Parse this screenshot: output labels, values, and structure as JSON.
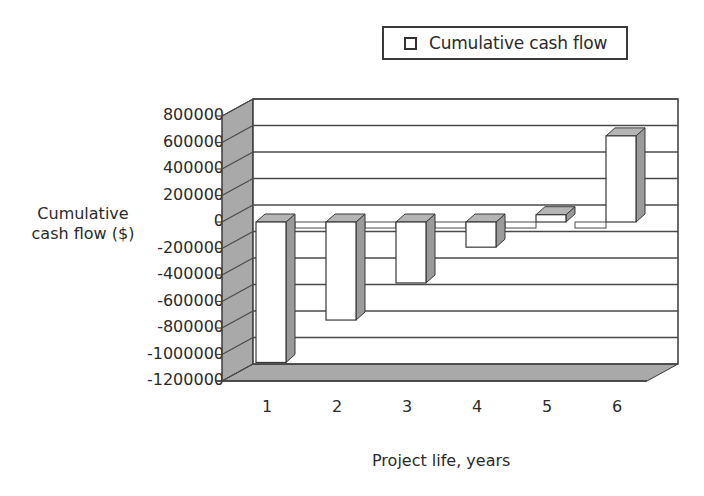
{
  "chart_data": {
    "type": "bar",
    "style": "3d-column",
    "title": "",
    "categories": [
      "1",
      "2",
      "3",
      "4",
      "5",
      "6"
    ],
    "series": [
      {
        "name": "Cumulative cash flow",
        "values": [
          -1060000,
          -740000,
          -460000,
          -190000,
          55000,
          650000
        ]
      }
    ],
    "xlabel": "Project life, years",
    "ylabel": "Cumulative cash flow ($)",
    "ylim": [
      -1200000,
      800000
    ],
    "yticks": [
      "800000",
      "600000",
      "400000",
      "200000",
      "0",
      "-200000",
      "-400000",
      "-600000",
      "-800000",
      "-1000000",
      "-1200000"
    ],
    "grid": true,
    "legend_position": "top-right"
  },
  "legend": {
    "label": "Cumulative cash flow"
  },
  "axes": {
    "ylabel_line1": "Cumulative",
    "ylabel_line2": "cash flow ($)",
    "xlabel": "Project life, years"
  },
  "colors": {
    "wall": "#a9a9a9",
    "bar_front": "#ffffff",
    "bar_side": "#9a9a9a",
    "bar_top": "#b5b5b5",
    "gridline": "#4a4a4a",
    "outline": "#3a3a3a"
  }
}
